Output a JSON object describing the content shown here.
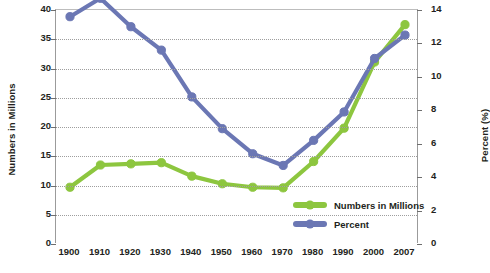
{
  "chart_data": {
    "type": "line",
    "title": "",
    "xlabel": "",
    "categories": [
      "1900",
      "1910",
      "1920",
      "1930",
      "1940",
      "1950",
      "1960",
      "1970",
      "1980",
      "1990",
      "2000",
      "2007"
    ],
    "grid": true,
    "legend_position": "inside-bottom-right",
    "axes": {
      "left": {
        "label": "Numbers in Millions",
        "ticks": [
          "40",
          "35",
          "30",
          "25",
          "20",
          "15",
          "10",
          "5",
          "0"
        ],
        "tick_values": [
          40,
          35,
          30,
          25,
          20,
          15,
          10,
          5,
          0
        ],
        "min": 0,
        "max": 40
      },
      "right": {
        "label": "Percent (%)",
        "ticks": [
          "14",
          "12",
          "10",
          "8",
          "6",
          "4",
          "2",
          "0"
        ],
        "tick_values": [
          14,
          12,
          10,
          8,
          6,
          4,
          2,
          0
        ],
        "min": 0,
        "max": 14
      }
    },
    "series": [
      {
        "name": "Numbers in Millions",
        "axis": "left",
        "color": "#8DC63F",
        "marker_color": "#8DC63F",
        "values": [
          9.7,
          13.5,
          13.7,
          13.9,
          11.6,
          10.3,
          9.7,
          9.6,
          14.1,
          19.8,
          31.1,
          37.5
        ]
      },
      {
        "name": "Percent",
        "axis": "right",
        "color": "#6B77B4",
        "marker_color": "#6B77B4",
        "values": [
          13.6,
          14.7,
          13.0,
          11.6,
          8.8,
          6.9,
          5.4,
          4.7,
          6.2,
          7.9,
          11.1,
          12.5
        ]
      }
    ],
    "legend": [
      {
        "label": "Numbers in Millions",
        "color": "#8DC63F"
      },
      {
        "label": "Percent",
        "color": "#6B77B4"
      }
    ]
  }
}
